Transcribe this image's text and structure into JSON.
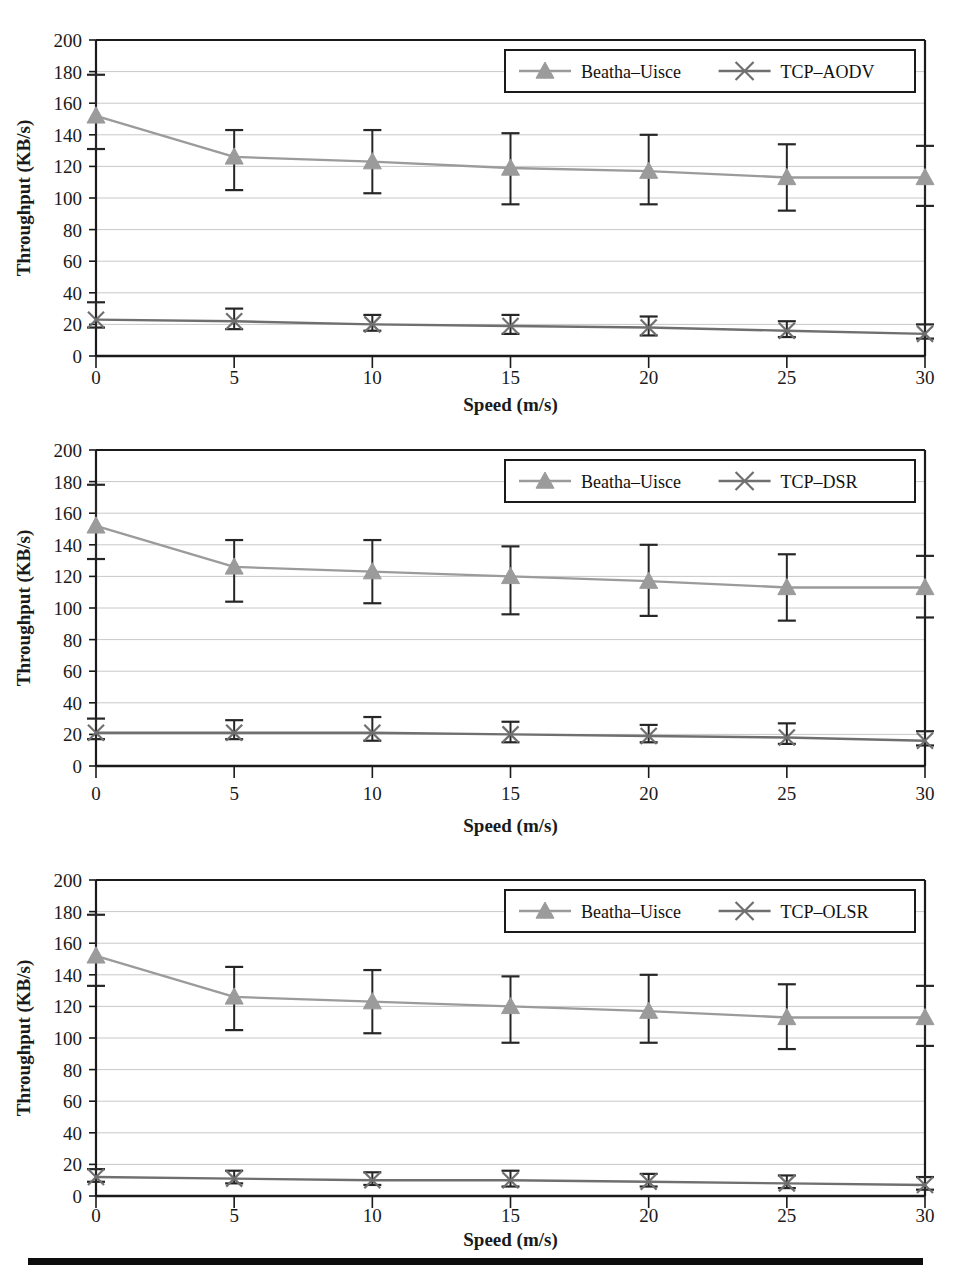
{
  "figure": {
    "background_color": "#ffffff",
    "series_colors": {
      "beatha_uisce": "#9b9b9b",
      "tcp": "#6f6f6f",
      "error_bar": "#262626",
      "axis": "#1a1a1a",
      "gridline": "#c8c8c8"
    },
    "bottom_rule_color": "#0d0d0d"
  },
  "axes": {
    "ylabel": "Throughput (KB/s)",
    "xlabel": "Speed (m/s)",
    "ytick_labels": [
      "0",
      "20",
      "40",
      "60",
      "80",
      "100",
      "120",
      "140",
      "160",
      "180",
      "200"
    ],
    "xtick_labels": [
      "0",
      "5",
      "10",
      "15",
      "20",
      "25",
      "30"
    ],
    "ylim": [
      0,
      200
    ],
    "xlim": [
      0,
      30
    ],
    "ystep": 20,
    "grid": true
  },
  "chart_data": [
    {
      "type": "line",
      "index": 0,
      "title": "",
      "xlabel": "Speed (m/s)",
      "ylabel": "Throughput (KB/s)",
      "x": [
        0,
        5,
        10,
        15,
        20,
        25,
        30
      ],
      "xlim": [
        0,
        30
      ],
      "ylim": [
        0,
        200
      ],
      "grid": true,
      "legend_position": "top-right",
      "series": [
        {
          "name": "Beatha–Uisce",
          "marker": "triangle",
          "color": "#9b9b9b",
          "values": [
            152,
            126,
            123,
            119,
            117,
            113,
            113
          ],
          "err_low": [
            131,
            105,
            103,
            96,
            96,
            92,
            95
          ],
          "err_high": [
            178,
            143,
            143,
            141,
            140,
            134,
            133
          ]
        },
        {
          "name": "TCP–AODV",
          "marker": "cross",
          "color": "#6f6f6f",
          "values": [
            23,
            22,
            20,
            19,
            18,
            16,
            14
          ],
          "err_low": [
            18,
            17,
            16,
            14,
            13,
            12,
            11
          ],
          "err_high": [
            34,
            30,
            26,
            26,
            25,
            22,
            20
          ]
        }
      ]
    },
    {
      "type": "line",
      "index": 1,
      "title": "",
      "xlabel": "Speed (m/s)",
      "ylabel": "Throughput (KB/s)",
      "x": [
        0,
        5,
        10,
        15,
        20,
        25,
        30
      ],
      "xlim": [
        0,
        30
      ],
      "ylim": [
        0,
        200
      ],
      "grid": true,
      "legend_position": "top-right",
      "series": [
        {
          "name": "Beatha–Uisce",
          "marker": "triangle",
          "color": "#9b9b9b",
          "values": [
            152,
            126,
            123,
            120,
            117,
            113,
            113
          ],
          "err_low": [
            131,
            104,
            103,
            96,
            95,
            92,
            94
          ],
          "err_high": [
            178,
            143,
            143,
            139,
            140,
            134,
            133
          ]
        },
        {
          "name": "TCP–DSR",
          "marker": "cross",
          "color": "#6f6f6f",
          "values": [
            21,
            21,
            21,
            20,
            19,
            18,
            16
          ],
          "err_low": [
            17,
            17,
            16,
            15,
            15,
            14,
            13
          ],
          "err_high": [
            30,
            29,
            31,
            28,
            26,
            27,
            22
          ]
        }
      ]
    },
    {
      "type": "line",
      "index": 2,
      "title": "",
      "xlabel": "Speed (m/s)",
      "ylabel": "Throughput (KB/s)",
      "x": [
        0,
        5,
        10,
        15,
        20,
        25,
        30
      ],
      "xlim": [
        0,
        30
      ],
      "ylim": [
        0,
        200
      ],
      "grid": true,
      "legend_position": "top-right",
      "series": [
        {
          "name": "Beatha–Uisce",
          "marker": "triangle",
          "color": "#9b9b9b",
          "values": [
            152,
            126,
            123,
            120,
            117,
            113,
            113
          ],
          "err_low": [
            133,
            105,
            103,
            97,
            97,
            93,
            95
          ],
          "err_high": [
            178,
            145,
            143,
            139,
            140,
            134,
            133
          ]
        },
        {
          "name": "TCP–OLSR",
          "marker": "cross",
          "color": "#6f6f6f",
          "values": [
            12,
            11,
            10,
            10,
            9,
            8,
            7
          ],
          "err_low": [
            9,
            8,
            7,
            6,
            6,
            5,
            4
          ],
          "err_high": [
            17,
            16,
            15,
            16,
            14,
            13,
            12
          ]
        }
      ]
    }
  ]
}
